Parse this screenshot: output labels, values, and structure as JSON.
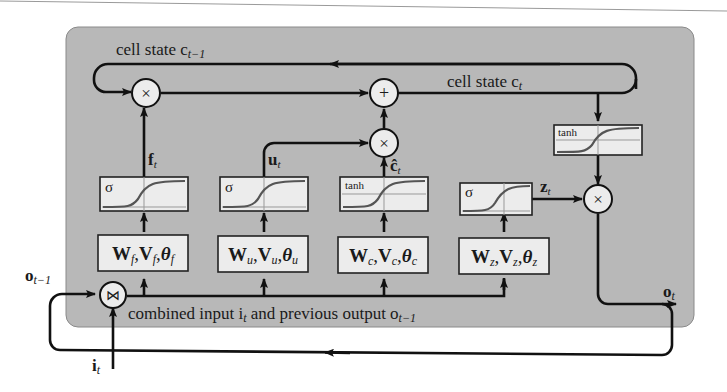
{
  "diagram": {
    "colors": {
      "cell_background": "#b8b8b8",
      "box_fill": "#ececec",
      "line": "#111111",
      "curve": "#555555",
      "page": "#ffffff"
    },
    "labels": {
      "cell_state_prev": "cell state c",
      "cell_state_prev_sub": "t−1",
      "cell_state_cur": "cell state c",
      "cell_state_cur_sub": "t",
      "combined_input": "combined input i",
      "combined_input_sub": "t",
      "combined_input_mid": " and previous output o",
      "combined_input_sub2": "t−1",
      "prev_output": "o",
      "prev_output_sub": "t−1",
      "input": "i",
      "input_sub": "t",
      "output": "o",
      "output_sub": "t"
    },
    "operators": {
      "multiply": "×",
      "add": "+",
      "concat": "⋈"
    },
    "gates": [
      {
        "name": "forget",
        "activation": "σ",
        "signal": "f",
        "signal_sub": "t",
        "params": "W",
        "p1_sub": "f",
        "p2": "V",
        "p2_sub": "f",
        "p3": "θ",
        "p3_sub": "f"
      },
      {
        "name": "update",
        "activation": "σ",
        "signal": "u",
        "signal_sub": "t",
        "params": "W",
        "p1_sub": "u",
        "p2": "V",
        "p2_sub": "u",
        "p3": "θ",
        "p3_sub": "u"
      },
      {
        "name": "candidate",
        "activation": "tanh",
        "signal": "ĉ",
        "signal_sub": "t",
        "params": "W",
        "p1_sub": "c",
        "p2": "V",
        "p2_sub": "c",
        "p3": "θ",
        "p3_sub": "c"
      },
      {
        "name": "output",
        "activation": "σ",
        "signal": "z",
        "signal_sub": "t",
        "params": "W",
        "p1_sub": "z",
        "p2": "V",
        "p2_sub": "z",
        "p3": "θ",
        "p3_sub": "z"
      }
    ],
    "output_activation": "tanh"
  }
}
